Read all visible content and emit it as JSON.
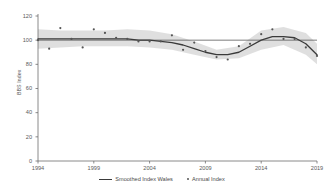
{
  "chart_data": {
    "type": "line",
    "title": "",
    "xlabel": "",
    "ylabel": "BBS Index",
    "xlim": [
      1994,
      2019
    ],
    "ylim": [
      0,
      120
    ],
    "grid": false,
    "legend_position": "bottom",
    "x_ticks": [
      "1994",
      "1999",
      "2004",
      "2009",
      "2014",
      "2019"
    ],
    "x_tick_values": [
      1994,
      1999,
      2004,
      2009,
      2014,
      2019
    ],
    "y_ticks": [
      "0",
      "20",
      "40",
      "60",
      "80",
      "100",
      "120"
    ],
    "y_tick_values": [
      0,
      20,
      40,
      60,
      80,
      100,
      120
    ],
    "reference_line": 100,
    "series": [
      {
        "name": "Smoothed Index Wales",
        "type": "line",
        "color": "#3a3a3a",
        "x": [
          1994,
          1995,
          1996,
          1997,
          1998,
          1999,
          2000,
          2001,
          2002,
          2003,
          2004,
          2005,
          2006,
          2007,
          2008,
          2009,
          2010,
          2011,
          2012,
          2013,
          2014,
          2015,
          2016,
          2017,
          2018,
          2019
        ],
        "values": [
          101,
          101,
          101,
          101,
          101,
          101,
          101,
          101,
          101,
          100,
          100,
          99,
          98,
          96,
          93,
          90,
          88,
          88,
          90,
          95,
          100,
          103,
          103,
          102,
          97,
          88
        ]
      },
      {
        "name": "Annual Index",
        "type": "scatter",
        "color": "#555555",
        "x": [
          1994,
          1995,
          1996,
          1997,
          1998,
          1999,
          2000,
          2001,
          2002,
          2003,
          2004,
          2005,
          2006,
          2007,
          2008,
          2009,
          2010,
          2011,
          2012,
          2013,
          2014,
          2015,
          2016,
          2017,
          2018,
          2019
        ],
        "values": [
          100,
          93,
          110,
          101,
          94,
          109,
          106,
          102,
          101,
          99,
          99,
          99,
          104,
          92,
          98,
          91,
          86,
          84,
          95,
          97,
          105,
          109,
          101,
          101,
          94,
          87
        ]
      }
    ],
    "confidence_band": {
      "name": "Smoothed Index confidence interval",
      "color": "#d9d9d9",
      "x": [
        1994,
        1996,
        1998,
        2000,
        2002,
        2004,
        2006,
        2008,
        2010,
        2012,
        2014,
        2016,
        2018,
        2019
      ],
      "lower": [
        93,
        94,
        95,
        95,
        95,
        94,
        92,
        88,
        84,
        85,
        92,
        96,
        88,
        80
      ],
      "upper": [
        109,
        108,
        108,
        108,
        109,
        108,
        105,
        99,
        92,
        95,
        108,
        111,
        106,
        97
      ]
    }
  },
  "legend": {
    "items": [
      {
        "label": "Smoothed Index Wales",
        "marker": "line"
      },
      {
        "label": "Annual Index",
        "marker": "dot"
      }
    ]
  },
  "axes": {
    "y_title": "BBS Index"
  }
}
